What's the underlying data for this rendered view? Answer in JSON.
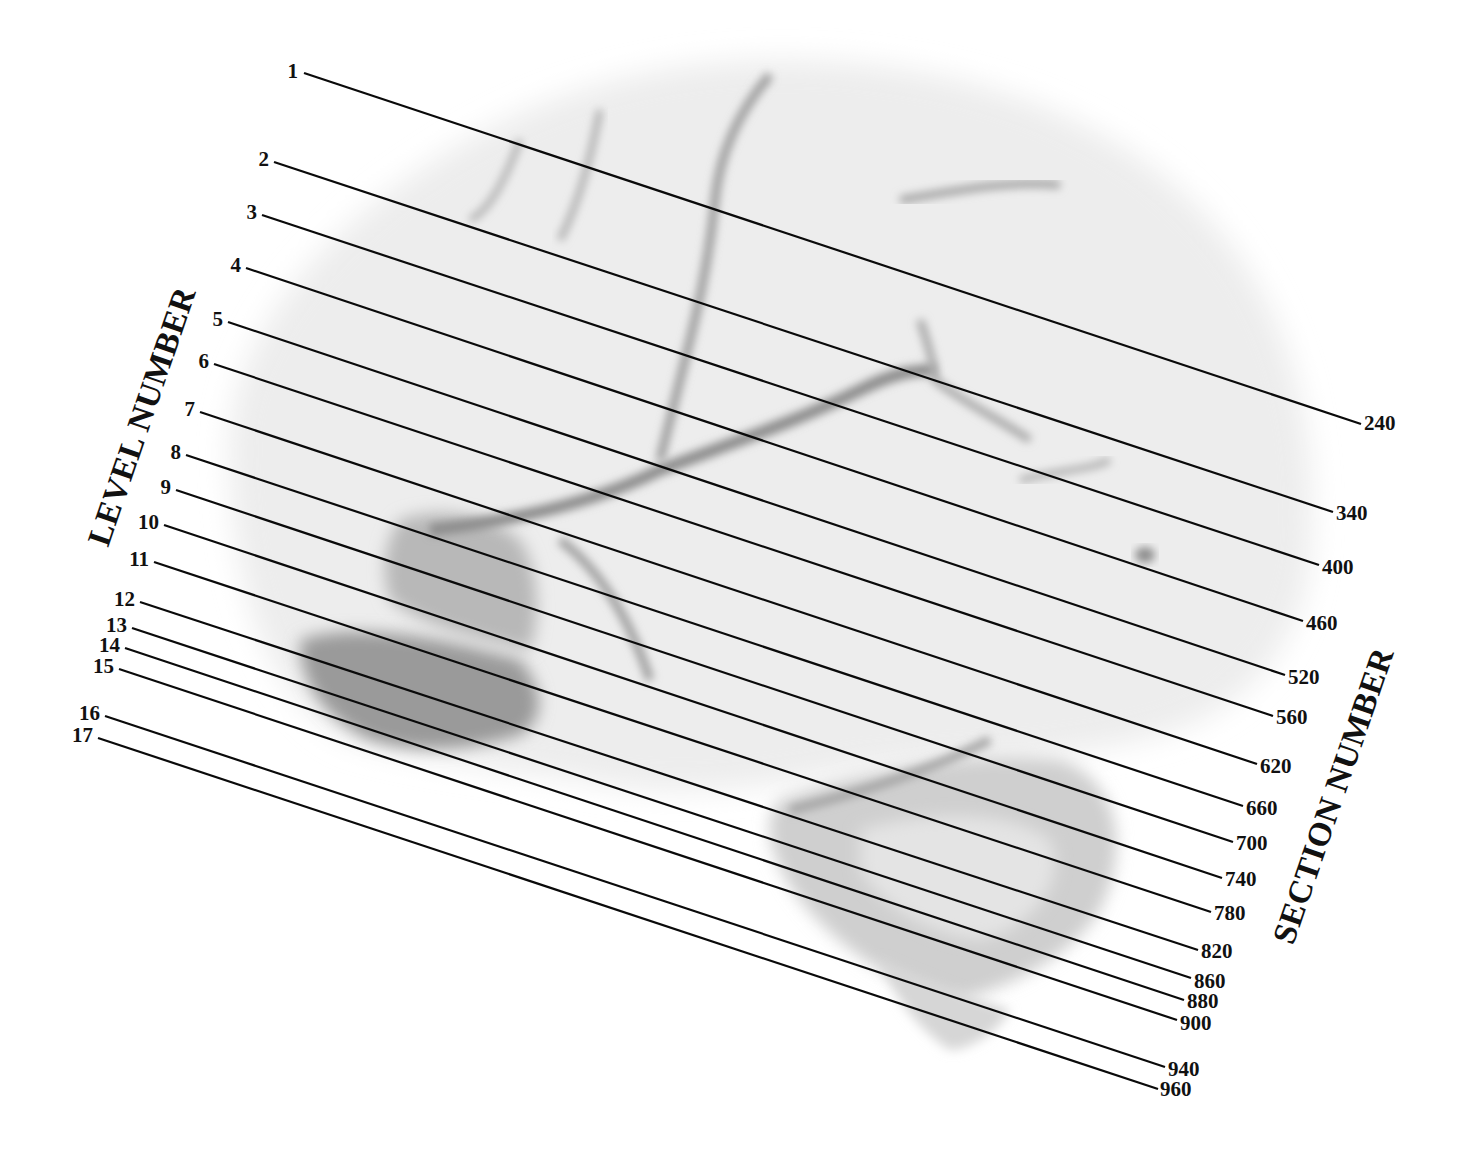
{
  "figure": {
    "left_axis_title": "LEVEL NUMBER",
    "right_axis_title": "SECTION NUMBER",
    "line_color": "#0a0a0a",
    "background_color": "#ffffff",
    "brain_tone_light": "#ececec",
    "brain_tone_dark": "#7a7a7a"
  },
  "levels": [
    {
      "level": "1",
      "section": "240"
    },
    {
      "level": "2",
      "section": "340"
    },
    {
      "level": "3",
      "section": "400"
    },
    {
      "level": "4",
      "section": "460"
    },
    {
      "level": "5",
      "section": "520"
    },
    {
      "level": "6",
      "section": "560"
    },
    {
      "level": "7",
      "section": "620"
    },
    {
      "level": "8",
      "section": "660"
    },
    {
      "level": "9",
      "section": "700"
    },
    {
      "level": "10",
      "section": "740"
    },
    {
      "level": "11",
      "section": "780"
    },
    {
      "level": "12",
      "section": "820"
    },
    {
      "level": "13",
      "section": "860"
    },
    {
      "level": "14",
      "section": "880"
    },
    {
      "level": "15",
      "section": "900"
    },
    {
      "level": "16",
      "section": "940"
    },
    {
      "level": "17",
      "section": "960"
    }
  ]
}
